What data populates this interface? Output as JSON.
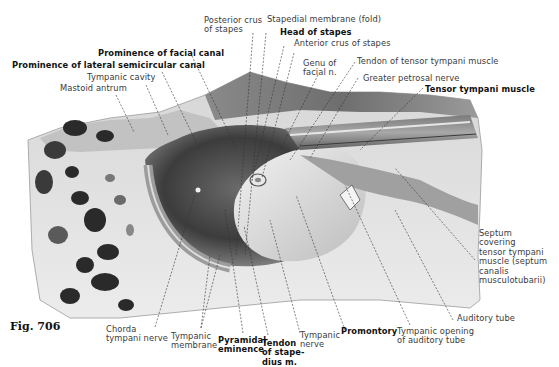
{
  "figure": {
    "number": "Fig. 706"
  },
  "labels": {
    "posterior_crus": "Posterior crus\nof stapes",
    "posterior_crus_l1": "Posterior crus",
    "posterior_crus_l2": "of stapes",
    "stapedial_membrane": "Stapedial membrane (fold)",
    "head_of_stapes": "Head of stapes",
    "anterior_crus": "Anterior crus of stapes",
    "prominence_facial": "Prominence of facial canal",
    "prominence_lateral": "Prominence of lateral semicircular canal",
    "tympanic_cavity": "Tympanic cavity",
    "mastoid_antrum": "Mastoid antrum",
    "genu_l1": "Genu of",
    "genu_l2": "facial n.",
    "tendon_tensor": "Tendon of tensor tympani muscle",
    "greater_petrosal": "Greater petrosal nerve",
    "tensor_tympani": "Tensor tympani muscle",
    "septum_l1": "Septum",
    "septum_l2": "covering",
    "septum_l3": "tensor tympani",
    "septum_l4": "muscle (septum",
    "septum_l5": "canalis",
    "septum_l6": "musculotubarii)",
    "auditory_tube": "Auditory tube",
    "tympanic_opening_l1": "Tympanic opening",
    "tympanic_opening_l2": "of auditory tube",
    "promontory": "Promontory",
    "tympanic_nerve_l1": "Tympanic",
    "tympanic_nerve_l2": "nerve",
    "tendon_stapedius_l1": "Tendon",
    "tendon_stapedius_l2": "of stape-",
    "tendon_stapedius_l3": "dius m.",
    "pyramidal_l1": "Pyramidal",
    "pyramidal_l2": "eminence",
    "tympanic_membrane_l1": "Tympanic",
    "tympanic_membrane_l2": "membrane",
    "chorda_l1": "Chorda",
    "chorda_l2": "tympani nerve"
  },
  "colors": {
    "background": "#ffffff",
    "bone_light": "#e4e4e4",
    "bone_mid": "#b8b8b8",
    "shadow": "#5a5a5a",
    "dark": "#1e1e1e",
    "text": "#3a3a3a",
    "text_bold": "#111111"
  }
}
